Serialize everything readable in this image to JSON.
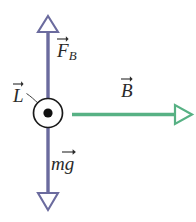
{
  "figure": {
    "background_color": "#ffffff",
    "width": 196,
    "height": 222
  },
  "colors": {
    "wire_vector": "#6b6b9e",
    "field_vector": "#57b184",
    "outline": "#1a1a1a",
    "label_text": "#2a2a2a"
  },
  "elements": {
    "force_up_arrow": {
      "name": "F_B",
      "label": "F",
      "subscript": "B",
      "color": "#6b6b9e",
      "direction": "up",
      "arrowhead": "hollow-triangle"
    },
    "weight_down_arrow": {
      "name": "mg",
      "label": "mg",
      "color": "#6b6b9e",
      "direction": "down",
      "arrowhead": "hollow-triangle"
    },
    "magnetic_field_arrow": {
      "name": "B",
      "label": "B",
      "color": "#57b184",
      "direction": "right",
      "arrowhead": "hollow-triangle"
    },
    "current_symbol": {
      "name": "L",
      "label": "L",
      "symbol": "dot-in-circle",
      "meaning": "current out of page",
      "color": "#1a1a1a"
    }
  },
  "labels": {
    "force": "F",
    "force_sub": "B",
    "length_current": "L",
    "field": "B",
    "weight": "mg"
  }
}
